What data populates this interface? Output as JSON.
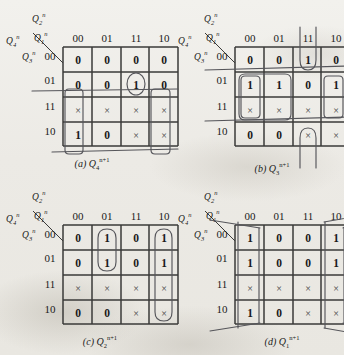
{
  "figure": {
    "background_color": "#efeeea",
    "ink_color": "#1a1a1a",
    "loop_color": "#55555a"
  },
  "axis_labels": {
    "top_var": "Q2n",
    "left_var": "Q4n",
    "mid_var": "Q1n",
    "bottom_var": "Q3n",
    "top_var_base": "Q",
    "top_var_sub": "2",
    "top_var_sup": "n",
    "left_var_base": "Q",
    "left_var_sub": "4",
    "left_var_sup": "n",
    "mid_var_base": "Q",
    "mid_var_sub": "1",
    "mid_var_sup": "n",
    "bottom_var_base": "Q",
    "bottom_var_sub": "3",
    "bottom_var_sup": "n"
  },
  "column_headers": [
    "00",
    "01",
    "11",
    "10"
  ],
  "row_headers": [
    "00",
    "01",
    "11",
    "10"
  ],
  "maps": [
    {
      "id": "a",
      "caption_letter": "(a)",
      "caption_base": "Q",
      "caption_sub": "4",
      "caption_sup": "n+1",
      "caption_full": "(a) Q4n+1",
      "rows": [
        [
          "0",
          "0",
          "0",
          "0"
        ],
        [
          "0",
          "0",
          "1",
          "0"
        ],
        [
          "×",
          "×",
          "×",
          "×"
        ],
        [
          "1",
          "0",
          "×",
          "×"
        ]
      ],
      "loops": [
        {
          "name": "oval-col11-row01",
          "type": "oval",
          "cells": [
            "r1c2"
          ]
        },
        {
          "name": "wrap-col00-rows11-10",
          "type": "vertical-wrap",
          "cells": [
            "r2c0",
            "r3c0"
          ]
        },
        {
          "name": "wrap-col10-rows11-10",
          "type": "vertical-wrap",
          "cells": [
            "r2c3",
            "r3c3"
          ]
        },
        {
          "name": "band-row11",
          "type": "horizontal-wrap",
          "cells": [
            "r2c0",
            "r2c1",
            "r2c2",
            "r2c3"
          ]
        }
      ]
    },
    {
      "id": "b",
      "caption_letter": "(b)",
      "caption_base": "Q",
      "caption_sub": "3",
      "caption_sup": "n+1",
      "caption_full": "(b) Q3n+1",
      "rows": [
        [
          "0",
          "0",
          "1",
          "0"
        ],
        [
          "1",
          "1",
          "0",
          "1"
        ],
        [
          "×",
          "×",
          "×",
          "×"
        ],
        [
          "0",
          "0",
          "×",
          "×"
        ]
      ],
      "loops": [
        {
          "name": "wrap-col11-row00-row10",
          "type": "vertical-wrap-ends",
          "cells": [
            "r0c2",
            "r3c2"
          ]
        },
        {
          "name": "block-cols0001-rows0111",
          "type": "block2x2",
          "cells": [
            "r1c0",
            "r1c1",
            "r2c0",
            "r2c1"
          ]
        },
        {
          "name": "wrap-col10-rows01-11",
          "type": "vertical-wrap",
          "cells": [
            "r1c3",
            "r2c3"
          ]
        },
        {
          "name": "band-rows01-11",
          "type": "horizontal-wrap",
          "cells": [
            "r1c0",
            "r2c3"
          ]
        }
      ]
    },
    {
      "id": "c",
      "caption_letter": "(c)",
      "caption_base": "Q",
      "caption_sub": "2",
      "caption_sup": "n+1",
      "caption_full": "(c) Q2n+1",
      "rows": [
        [
          "0",
          "1",
          "0",
          "1"
        ],
        [
          "0",
          "1",
          "0",
          "1"
        ],
        [
          "×",
          "×",
          "×",
          "×"
        ],
        [
          "0",
          "0",
          "×",
          "×"
        ]
      ],
      "loops": [
        {
          "name": "oval-col01-rows00-01",
          "type": "oval-vertical",
          "cells": [
            "r0c1",
            "r1c1"
          ]
        },
        {
          "name": "oval-col10-all-rows",
          "type": "oval-vertical-tall",
          "cells": [
            "r0c3",
            "r1c3",
            "r2c3",
            "r3c3"
          ]
        }
      ]
    },
    {
      "id": "d",
      "caption_letter": "(d)",
      "caption_base": "Q",
      "caption_sub": "1",
      "caption_sup": "n+1",
      "caption_full": "(d) Q1n+1",
      "rows": [
        [
          "1",
          "0",
          "0",
          "1"
        ],
        [
          "1",
          "0",
          "0",
          "1"
        ],
        [
          "×",
          "×",
          "×",
          "×"
        ],
        [
          "1",
          "0",
          "×",
          "×"
        ]
      ],
      "loops": [
        {
          "name": "wrap-col00-all-rows",
          "type": "vertical-wrap-full",
          "cells": [
            "r0c0",
            "r1c0",
            "r2c0",
            "r3c0"
          ]
        },
        {
          "name": "wrap-col10-all-rows",
          "type": "vertical-wrap-full",
          "cells": [
            "r0c3",
            "r1c3",
            "r2c3",
            "r3c3"
          ]
        }
      ]
    }
  ]
}
